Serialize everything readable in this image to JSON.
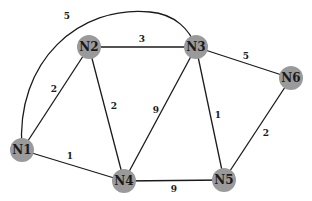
{
  "graph": {
    "nodes": [
      {
        "id": "N1",
        "label": "N1",
        "x": 22,
        "y": 150
      },
      {
        "id": "N2",
        "label": "N2",
        "x": 89,
        "y": 47
      },
      {
        "id": "N3",
        "label": "N3",
        "x": 196,
        "y": 47
      },
      {
        "id": "N4",
        "label": "N4",
        "x": 124,
        "y": 181
      },
      {
        "id": "N5",
        "label": "N5",
        "x": 224,
        "y": 180
      },
      {
        "id": "N6",
        "label": "N6",
        "x": 291,
        "y": 78
      }
    ],
    "edges": [
      {
        "from": "N1",
        "to": "N3",
        "weight": "5",
        "curved": true
      },
      {
        "from": "N1",
        "to": "N2",
        "weight": "2"
      },
      {
        "from": "N1",
        "to": "N4",
        "weight": "1"
      },
      {
        "from": "N2",
        "to": "N3",
        "weight": "3"
      },
      {
        "from": "N2",
        "to": "N4",
        "weight": "2"
      },
      {
        "from": "N3",
        "to": "N4",
        "weight": "9"
      },
      {
        "from": "N3",
        "to": "N5",
        "weight": "1"
      },
      {
        "from": "N3",
        "to": "N6",
        "weight": "5"
      },
      {
        "from": "N4",
        "to": "N5",
        "weight": "9"
      },
      {
        "from": "N5",
        "to": "N6",
        "weight": "2"
      }
    ],
    "colors": {
      "node_fill": "#9a9a9a",
      "edge": "#1a1a1a",
      "text": "#1a1a1a",
      "background": "#ffffff"
    }
  }
}
